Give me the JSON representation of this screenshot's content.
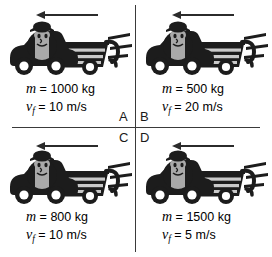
{
  "figure": {
    "type": "physics-diagram",
    "arrow_icon": "left-arrow-icon",
    "vehicle_icon": "car-towing-trailer-icon",
    "colors": {
      "line": "#3a3a3a",
      "arrow": "#2b2b2b",
      "body_dark": "#1c1c1c",
      "body_mid": "#4a4a4a",
      "body_light": "#a9a9a9",
      "highlight": "#d6d6d6",
      "background": "#ffffff"
    }
  },
  "quadrants": [
    {
      "id": "A",
      "label": "A",
      "position": "top-left",
      "mass_symbol": "m",
      "mass_text": "= 1000 kg",
      "mass_value": 1000,
      "mass_unit": "kg",
      "velocity_symbol": "v",
      "velocity_subscript": "f",
      "velocity_text": "= 10 m/s",
      "velocity_value": 10,
      "velocity_unit": "m/s",
      "direction": "left"
    },
    {
      "id": "B",
      "label": "B",
      "position": "top-right",
      "mass_symbol": "m",
      "mass_text": "= 500 kg",
      "mass_value": 500,
      "mass_unit": "kg",
      "velocity_symbol": "v",
      "velocity_subscript": "f",
      "velocity_text": "= 20 m/s",
      "velocity_value": 20,
      "velocity_unit": "m/s",
      "direction": "left"
    },
    {
      "id": "C",
      "label": "C",
      "position": "bottom-left",
      "mass_symbol": "m",
      "mass_text": "= 800 kg",
      "mass_value": 800,
      "mass_unit": "kg",
      "velocity_symbol": "v",
      "velocity_subscript": "f",
      "velocity_text": "= 10 m/s",
      "velocity_value": 10,
      "velocity_unit": "m/s",
      "direction": "left"
    },
    {
      "id": "D",
      "label": "D",
      "position": "bottom-right",
      "mass_symbol": "m",
      "mass_text": "= 1500 kg",
      "mass_value": 1500,
      "mass_unit": "kg",
      "velocity_symbol": "v",
      "velocity_subscript": "f",
      "velocity_text": "= 5 m/s",
      "velocity_value": 5,
      "velocity_unit": "m/s",
      "direction": "left"
    }
  ]
}
